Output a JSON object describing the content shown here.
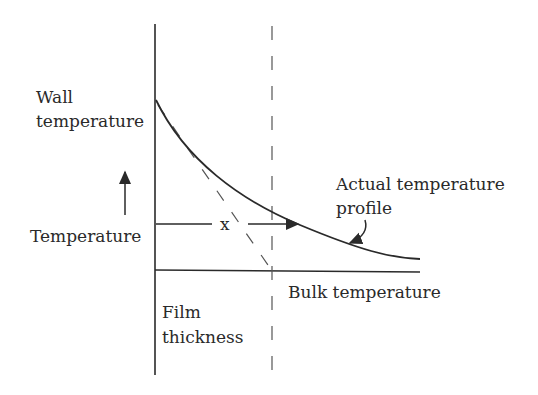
{
  "diagram": {
    "labels": {
      "wall_line1": "Wall",
      "wall_line2": "temperature",
      "temperature": "Temperature",
      "x": "x",
      "actual_line1": "Actual temperature",
      "actual_line2": "profile",
      "bulk": "Bulk temperature",
      "film_line1": "Film",
      "film_line2": "thickness"
    },
    "colors": {
      "ink": "#2a2a2a",
      "dash": "#555555",
      "background": "#ffffff"
    }
  }
}
